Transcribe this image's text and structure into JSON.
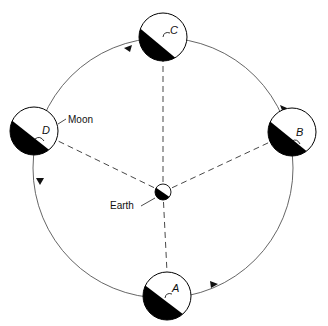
{
  "diagram": {
    "labels": {
      "earth": "Earth",
      "moon": "Moon"
    },
    "moons": [
      {
        "id": "A",
        "label": "A",
        "position": "bottom"
      },
      {
        "id": "B",
        "label": "B",
        "position": "right"
      },
      {
        "id": "C",
        "label": "C",
        "position": "top"
      },
      {
        "id": "D",
        "label": "D",
        "position": "left"
      }
    ],
    "orbit_direction": "counterclockwise",
    "colors": {
      "line": "#444444",
      "dark": "#000000",
      "light": "#ffffff"
    }
  }
}
